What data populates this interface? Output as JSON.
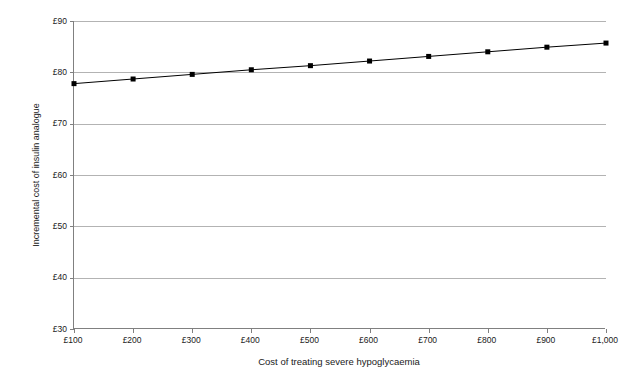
{
  "chart_data": {
    "type": "line",
    "title": "",
    "xlabel": "Cost of treating severe hypoglycaemia",
    "ylabel": "Incremental cost of insulin analogue",
    "x": [
      100,
      200,
      300,
      400,
      500,
      600,
      700,
      800,
      900,
      1000
    ],
    "xtick_labels": [
      "£100",
      "£200",
      "£300",
      "£400",
      "£500",
      "£600",
      "£700",
      "£800",
      "£900",
      "£1,000"
    ],
    "ytick_labels": [
      "£30",
      "£40",
      "£50",
      "£60",
      "£70",
      "£80",
      "£90"
    ],
    "ytick_values": [
      30,
      40,
      50,
      60,
      70,
      80,
      90
    ],
    "values": [
      77.8,
      78.7,
      79.6,
      80.5,
      81.3,
      82.2,
      83.1,
      84.0,
      84.9,
      85.7
    ],
    "series": [
      {
        "name": "Incremental cost of insulin analogue",
        "values": [
          77.8,
          78.7,
          79.6,
          80.5,
          81.3,
          82.2,
          83.1,
          84.0,
          84.9,
          85.7
        ]
      }
    ],
    "xlim": [
      100,
      1000
    ],
    "ylim": [
      30,
      90
    ],
    "grid": true,
    "grid_axis": "y",
    "legend": "none",
    "line_color": "#000000",
    "marker": "square",
    "marker_color": "#000000",
    "gridline_color": "#b3b3b3",
    "axis_color": "#808080",
    "background_color": "#ffffff"
  }
}
